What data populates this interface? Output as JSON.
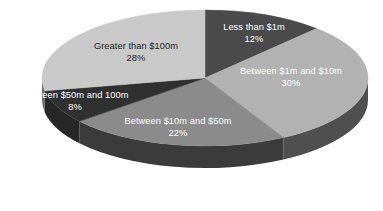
{
  "chart_data": {
    "type": "pie",
    "title": "",
    "subtitle": "",
    "xlabel": "",
    "ylabel": "",
    "legend_position": "none",
    "grid": false,
    "three_d": true,
    "value_unit": "%",
    "categories": [
      "Less than $1m",
      "Between $1m and $10m",
      "Between $10m and $50m",
      "Between $50m and 100m",
      "Greater than $100m"
    ],
    "values": [
      12,
      30,
      22,
      8,
      28
    ],
    "total": 100,
    "slices": [
      {
        "label": "Less than $1m",
        "percent_text": "12%",
        "value": 12,
        "color": "#4a4a4a",
        "side_color": "#343434",
        "text_color": "#ffffff"
      },
      {
        "label": "Between $1m and $10m",
        "percent_text": "30%",
        "value": 30,
        "color": "#b2b2b2",
        "side_color": "#4f4f4f",
        "text_color": "#ffffff"
      },
      {
        "label": "Between $10m and $50m",
        "percent_text": "22%",
        "value": 22,
        "color": "#8b8b8b",
        "side_color": "#3b3b3b",
        "text_color": "#ffffff"
      },
      {
        "label": "Between $50m and 100m",
        "percent_text": "8%",
        "value": 8,
        "color": "#303030",
        "side_color": "#272727",
        "text_color": "#ffffff"
      },
      {
        "label": "Greater than $100m",
        "percent_text": "28%",
        "value": 28,
        "color": "#c9c9c9",
        "side_color": "#6f6f6f",
        "text_color": "#1d1d1d"
      }
    ],
    "background_color": "#ffffff"
  }
}
